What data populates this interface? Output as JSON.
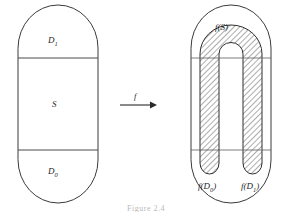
{
  "figure": {
    "kind": "mathematical-diagram",
    "map_label": "f",
    "caption": "Figure 2.4",
    "colors": {
      "outline": "#3a3a3a",
      "hatch": "#444444",
      "text": "#1f1f1f",
      "background": "#ffffff"
    }
  },
  "left_region": {
    "name": "domain-stadium",
    "bands": [
      {
        "id": "d1",
        "label": "D",
        "subscript": "1"
      },
      {
        "id": "s",
        "label": "S",
        "subscript": ""
      },
      {
        "id": "d0",
        "label": "D",
        "subscript": "0"
      }
    ]
  },
  "right_region": {
    "name": "image-stadium",
    "labels": [
      {
        "id": "fs",
        "label": "f(S)"
      },
      {
        "id": "fd0",
        "label": "f(D",
        "subscript": "0",
        "close": ")"
      },
      {
        "id": "fd1",
        "label": "f(D",
        "subscript": "1",
        "close": ")"
      }
    ]
  },
  "arrow": {
    "label": "f"
  }
}
